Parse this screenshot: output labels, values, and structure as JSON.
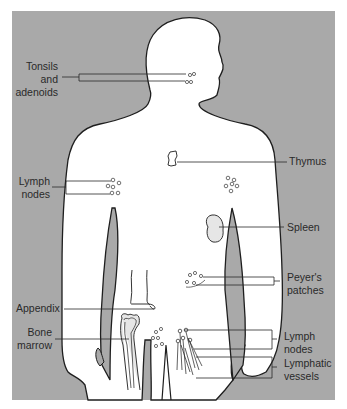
{
  "diagram": {
    "colors": {
      "background_panel": "#a9a9a9",
      "body_fill": "#ffffff",
      "outline": "#1e1e1e",
      "organ_fill": "#e6e6e6",
      "label_text": "#2a2a2a"
    },
    "labels": {
      "tonsils": {
        "line1": "Tonsils",
        "line2": "and",
        "line3": "adenoids"
      },
      "lymph_nodes_upper": {
        "line1": "Lymph",
        "line2": "nodes"
      },
      "thymus": "Thymus",
      "spleen": "Spleen",
      "peyers": {
        "line1": "Peyer's",
        "line2": "patches"
      },
      "appendix": "Appendix",
      "bone_marrow": {
        "line1": "Bone",
        "line2": "marrow"
      },
      "lymph_nodes_lower": {
        "line1": "Lymph",
        "line2": "nodes"
      },
      "lymphatic_vessels": {
        "line1": "Lymphatic",
        "line2": "vessels"
      }
    }
  }
}
